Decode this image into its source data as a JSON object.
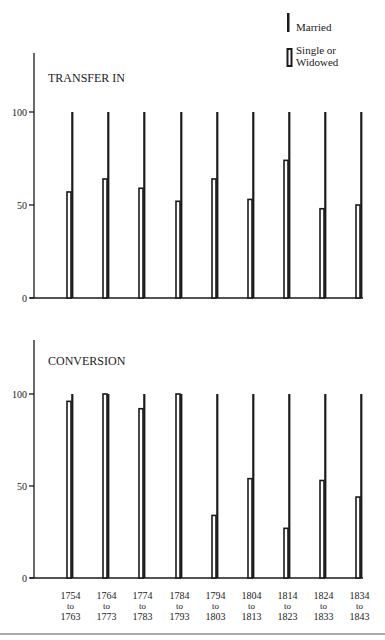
{
  "legend": {
    "married": "Married",
    "single_line1": "Single or",
    "single_line2": "Widowed"
  },
  "colors": {
    "ink": "#1a1a1a",
    "background": "#ffffff"
  },
  "x_labels": [
    {
      "from": "1754",
      "to_word": "to",
      "to": "1763"
    },
    {
      "from": "1764",
      "to_word": "to",
      "to": "1773"
    },
    {
      "from": "1774",
      "to_word": "to",
      "to": "1783"
    },
    {
      "from": "1784",
      "to_word": "to",
      "to": "1793"
    },
    {
      "from": "1794",
      "to_word": "to",
      "to": "1803"
    },
    {
      "from": "1804",
      "to_word": "to",
      "to": "1813"
    },
    {
      "from": "1814",
      "to_word": "to",
      "to": "1823"
    },
    {
      "from": "1824",
      "to_word": "to",
      "to": "1833"
    },
    {
      "from": "1834",
      "to_word": "to",
      "to": "1843"
    }
  ],
  "chart_data": [
    {
      "type": "bar",
      "title": "TRANSFER IN",
      "xlabel": "",
      "ylabel": "",
      "ylim": [
        0,
        100
      ],
      "yticks": [
        0,
        50,
        100
      ],
      "grid": false,
      "legend_position": "top-right",
      "categories": [
        "1754 to 1763",
        "1764 to 1773",
        "1774 to 1783",
        "1784 to 1793",
        "1794 to 1803",
        "1804 to 1813",
        "1814 to 1823",
        "1824 to 1833",
        "1834 to 1843"
      ],
      "series": [
        {
          "name": "Single or Widowed",
          "style": "hollow",
          "values": [
            57,
            64,
            59,
            52,
            64,
            53,
            74,
            48,
            50
          ]
        },
        {
          "name": "Married",
          "style": "solid-line",
          "values": [
            100,
            100,
            100,
            100,
            100,
            100,
            100,
            100,
            100
          ]
        }
      ]
    },
    {
      "type": "bar",
      "title": "CONVERSION",
      "xlabel": "",
      "ylabel": "",
      "ylim": [
        0,
        100
      ],
      "yticks": [
        0,
        50,
        100
      ],
      "grid": false,
      "categories": [
        "1754 to 1763",
        "1764 to 1773",
        "1774 to 1783",
        "1784 to 1793",
        "1794 to 1803",
        "1804 to 1813",
        "1814 to 1823",
        "1824 to 1833",
        "1834 to 1843"
      ],
      "series": [
        {
          "name": "Single or Widowed",
          "style": "hollow",
          "values": [
            96,
            100,
            92,
            100,
            34,
            54,
            27,
            53,
            44
          ]
        },
        {
          "name": "Married",
          "style": "solid-line",
          "values": [
            100,
            100,
            100,
            100,
            100,
            100,
            100,
            100,
            100
          ]
        }
      ]
    }
  ]
}
